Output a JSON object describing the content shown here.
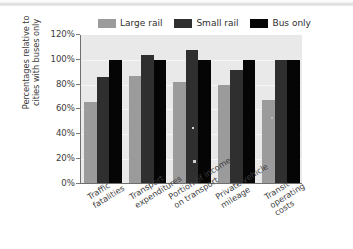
{
  "chart_data": {
    "type": "bar",
    "title": "",
    "subtitle": "",
    "xlabel": "",
    "ylabel": "Percentages relative to cities with buses only",
    "ylabel_lines": [
      "Percentages relative to",
      "cities with buses only"
    ],
    "ylim": [
      0,
      120
    ],
    "ytick_labels": [
      "120%",
      "100%",
      "80%",
      "60%",
      "40%",
      "20%",
      "0%"
    ],
    "ytick_values": [
      120,
      100,
      80,
      60,
      40,
      20,
      0
    ],
    "grid": true,
    "grid_axis": "y",
    "legend_position": "top",
    "categories": [
      "Traffic fatalities",
      "Transport expenditures",
      "Portion of income on transport",
      "Private vehicle mileage",
      "Transit operating costs"
    ],
    "category_lines": [
      [
        "Traffic",
        "fatalities"
      ],
      [
        "Transport",
        "expenditures"
      ],
      [
        "Portion of income",
        "on transport"
      ],
      [
        "Private vehicle",
        "mileage"
      ],
      [
        "Transit",
        "operating",
        "costs"
      ]
    ],
    "series": [
      {
        "name": "Large rail",
        "color": "#9b9b9b",
        "values": [
          65,
          86,
          81,
          79,
          67
        ]
      },
      {
        "name": "Small rail",
        "color": "#2f2f2f",
        "values": [
          85,
          103,
          107,
          91,
          99
        ]
      },
      {
        "name": "Bus only",
        "color": "#050505",
        "values": [
          99,
          99,
          99,
          99,
          99
        ]
      }
    ]
  },
  "legend": {
    "items": [
      {
        "label": "Large rail"
      },
      {
        "label": "Small rail"
      },
      {
        "label": "Bus only"
      }
    ]
  }
}
